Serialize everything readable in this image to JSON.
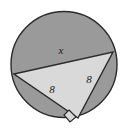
{
  "figure": {
    "background_color": "#ffffff",
    "circle": {
      "name": "circle",
      "cx": 64,
      "cy": 64.5,
      "r": 53,
      "fill_color": "#9a9a9a",
      "stroke_color": "#2b2b2b",
      "stroke_width": 1.4
    },
    "triangle": {
      "name": "inscribed-right-triangle",
      "fill_color": "#d9d9d9",
      "stroke_color": "#2b2b2b",
      "stroke_width": 1.4,
      "points": "14,74 113,52 78,118",
      "vertices": [
        {
          "name": "vertex-left",
          "x": 14,
          "y": 74
        },
        {
          "name": "vertex-right",
          "x": 113,
          "y": 52
        },
        {
          "name": "vertex-bottom",
          "x": 78,
          "y": 118
        }
      ]
    },
    "right_angle_marker": {
      "name": "right-angle-marker",
      "points": "69,110 76,117 70,122 64,115",
      "stroke_color": "#2b2b2b",
      "fill_color": "#d9d9d9",
      "stroke_width": 1.2
    },
    "labels": {
      "hypotenuse": {
        "text": "x",
        "x": 61,
        "y": 54,
        "font_size": 11
      },
      "leg_left": {
        "text": "8",
        "x": 52,
        "y": 93,
        "font_size": 11
      },
      "leg_right": {
        "text": "8",
        "x": 89,
        "y": 83,
        "font_size": 11
      }
    }
  }
}
